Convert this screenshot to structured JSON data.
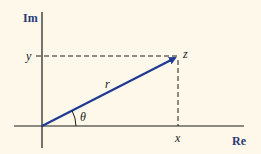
{
  "diagram": {
    "axes": {
      "horizontal_label": "Re",
      "vertical_label": "Im"
    },
    "labels": {
      "point": "z",
      "modulus": "r",
      "angle": "θ",
      "x_projection": "x",
      "y_projection": "y"
    },
    "colors": {
      "background": "#fdf8ea",
      "vector": "#1f3a93",
      "axis": "#1a1a1a",
      "axis_label": "#2a3a78"
    }
  }
}
